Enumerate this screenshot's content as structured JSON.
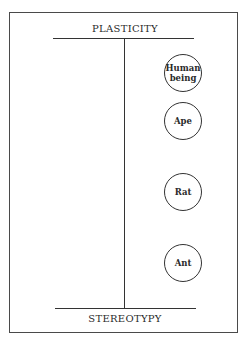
{
  "diagram": {
    "top_label": "PLASTICITY",
    "bottom_label": "STEREOTYPY",
    "nodes": [
      {
        "label": "Human being",
        "line1": "Human",
        "line2": "being"
      },
      {
        "label": "Ape"
      },
      {
        "label": "Rat"
      },
      {
        "label": "Ant"
      }
    ]
  }
}
